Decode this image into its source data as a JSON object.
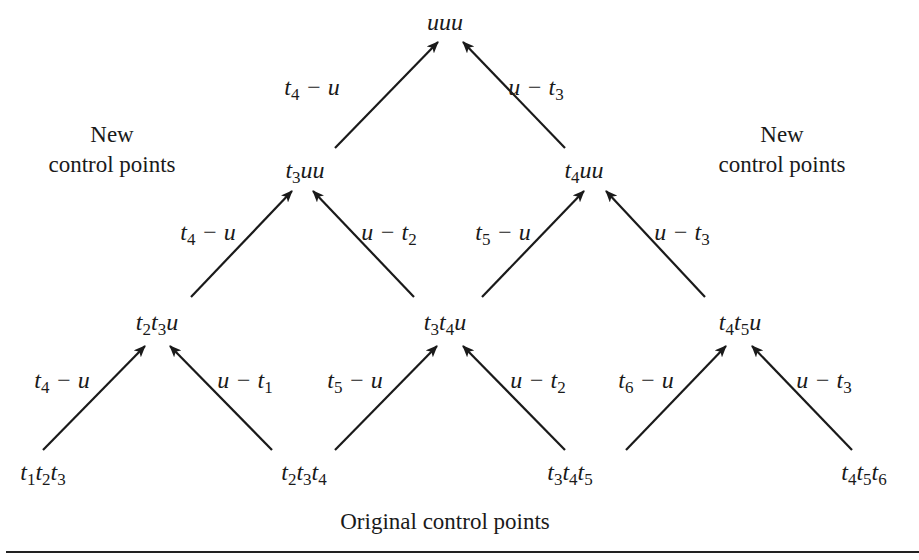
{
  "diagram": {
    "nodes": {
      "uuu": {
        "label_html": "uuu",
        "x": 445,
        "y": 22
      },
      "t3uu": {
        "label_html": "t<sub>3</sub>uu",
        "x": 305,
        "y": 170
      },
      "t4uu": {
        "label_html": "t<sub>4</sub>uu",
        "x": 584,
        "y": 170
      },
      "t2t3u": {
        "label_html": "t<sub>2</sub>t<sub>3</sub>u",
        "x": 157,
        "y": 322
      },
      "t3t4u": {
        "label_html": "t<sub>3</sub>t<sub>4</sub>u",
        "x": 445,
        "y": 322
      },
      "t4t5u": {
        "label_html": "t<sub>4</sub>t<sub>5</sub>u",
        "x": 740,
        "y": 322
      },
      "t1t2t3": {
        "label_html": "t<sub>1</sub>t<sub>2</sub>t<sub>3</sub>",
        "x": 43,
        "y": 472
      },
      "t2t3t4": {
        "label_html": "t<sub>2</sub>t<sub>3</sub>t<sub>4</sub>",
        "x": 304,
        "y": 472
      },
      "t3t4t5": {
        "label_html": "t<sub>3</sub>t<sub>4</sub>t<sub>5</sub>",
        "x": 570,
        "y": 472
      },
      "t4t5t6": {
        "label_html": "t<sub>4</sub>t<sub>5</sub>t<sub>6</sub>",
        "x": 864,
        "y": 472
      }
    },
    "edges": [
      {
        "from": "t3uu",
        "to": "uuu",
        "label_html": "t<sub>4</sub> &minus; u",
        "x1": 335,
        "y1": 148,
        "x2": 438,
        "y2": 42,
        "lx": 312,
        "ly": 87
      },
      {
        "from": "t4uu",
        "to": "uuu",
        "label_html": "u &minus; t<sub>3</sub>",
        "x1": 565,
        "y1": 148,
        "x2": 463,
        "y2": 42,
        "lx": 536,
        "ly": 87
      },
      {
        "from": "t2t3u",
        "to": "t3uu",
        "label_html": "t<sub>4</sub> &minus; u",
        "x1": 191,
        "y1": 297,
        "x2": 292,
        "y2": 191,
        "lx": 208,
        "ly": 232
      },
      {
        "from": "t3t4u",
        "to": "t3uu",
        "label_html": "u &minus; t<sub>2</sub>",
        "x1": 414,
        "y1": 297,
        "x2": 313,
        "y2": 191,
        "lx": 389,
        "ly": 232
      },
      {
        "from": "t3t4u",
        "to": "t4uu",
        "label_html": "t<sub>5</sub> &minus; u",
        "x1": 482,
        "y1": 297,
        "x2": 584,
        "y2": 191,
        "lx": 503,
        "ly": 232
      },
      {
        "from": "t4t5u",
        "to": "t4uu",
        "label_html": "u &minus; t<sub>3</sub>",
        "x1": 705,
        "y1": 297,
        "x2": 606,
        "y2": 191,
        "lx": 682,
        "ly": 232
      },
      {
        "from": "t1t2t3",
        "to": "t2t3u",
        "label_html": "t<sub>4</sub> &minus; u",
        "x1": 43,
        "y1": 450,
        "x2": 145,
        "y2": 346,
        "lx": 62,
        "ly": 380
      },
      {
        "from": "t2t3t4",
        "to": "t2t3u",
        "label_html": "u &minus; t<sub>1</sub>",
        "x1": 272,
        "y1": 450,
        "x2": 170,
        "y2": 346,
        "lx": 245,
        "ly": 380
      },
      {
        "from": "t2t3t4",
        "to": "t3t4u",
        "label_html": "t<sub>5</sub> &minus; u",
        "x1": 335,
        "y1": 450,
        "x2": 437,
        "y2": 346,
        "lx": 355,
        "ly": 380
      },
      {
        "from": "t3t4t5",
        "to": "t3t4u",
        "label_html": "u &minus; t<sub>2</sub>",
        "x1": 565,
        "y1": 450,
        "x2": 463,
        "y2": 346,
        "lx": 538,
        "ly": 380
      },
      {
        "from": "t3t4t5",
        "to": "t4t5u",
        "label_html": "t<sub>6</sub> &minus; u",
        "x1": 626,
        "y1": 450,
        "x2": 726,
        "y2": 346,
        "lx": 646,
        "ly": 380
      },
      {
        "from": "t4t5t6",
        "to": "t4t5u",
        "label_html": "u &minus; t<sub>3</sub>",
        "x1": 852,
        "y1": 450,
        "x2": 752,
        "y2": 346,
        "lx": 824,
        "ly": 380
      }
    ],
    "labels": {
      "new_left_line1": "New",
      "new_left_line2": "control points",
      "new_right_line1": "New",
      "new_right_line2": "control points",
      "original": "Original control points"
    },
    "colors": {
      "ink": "#1a1a1a",
      "background": "#ffffff"
    }
  }
}
